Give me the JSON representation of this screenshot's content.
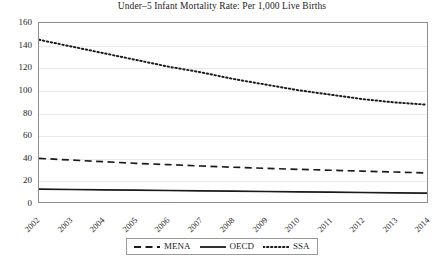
{
  "chart_data": {
    "type": "line",
    "title": "Under–5 Infant Mortality Rate: Per 1,000 Live Births",
    "xlabel": "",
    "ylabel": "",
    "x": [
      2002,
      2003,
      2004,
      2005,
      2006,
      2007,
      2008,
      2009,
      2010,
      2011,
      2012,
      2013,
      2014
    ],
    "categories": [
      "2002",
      "2003",
      "2004",
      "2005",
      "2006",
      "2007",
      "2008",
      "2009",
      "2010",
      "2011",
      "2012",
      "2013",
      "2014"
    ],
    "xlim": [
      2002,
      2014
    ],
    "ylim": [
      0,
      160
    ],
    "yticks": [
      0,
      20,
      40,
      60,
      80,
      100,
      120,
      140,
      160
    ],
    "xticks": [
      "2002",
      "2003",
      "2004",
      "2005",
      "2006",
      "2007",
      "2008",
      "2009",
      "2010",
      "2011",
      "2012",
      "2013",
      "2014"
    ],
    "grid": "horizontal",
    "legend_position": "below-center",
    "series": [
      {
        "name": "MENA",
        "style": "dashed",
        "color": "#1a1a1a",
        "values": [
          39,
          37.5,
          36,
          34.6,
          33.4,
          32.2,
          31.1,
          30.1,
          29.2,
          28.4,
          27.6,
          26.8,
          26
        ]
      },
      {
        "name": "OECD",
        "style": "solid",
        "color": "#1a1a1a",
        "values": [
          11.5,
          11.2,
          10.9,
          10.6,
          10.3,
          10.0,
          9.7,
          9.4,
          9.1,
          8.8,
          8.5,
          8.2,
          8.0
        ]
      },
      {
        "name": "SSA",
        "style": "dotted",
        "color": "#1a1a1a",
        "values": [
          145,
          139,
          133,
          127,
          121,
          116,
          110,
          105,
          100,
          96,
          92,
          89,
          87
        ]
      }
    ]
  },
  "legend": {
    "items": [
      {
        "label": "MENA",
        "key": "dashed-line-key"
      },
      {
        "label": "OECD",
        "key": "solid-line-key"
      },
      {
        "label": "SSA",
        "key": "dotted-line-key"
      }
    ]
  },
  "colors": {
    "ink": "#1a1a1a",
    "gridline": "#e9e9e9",
    "axis_border": "#8d8d8d",
    "background": "#ffffff"
  }
}
